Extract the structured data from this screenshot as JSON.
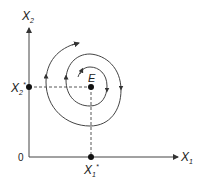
{
  "diagram": {
    "type": "phase-plane",
    "axes": {
      "x_label": "X",
      "x_sub": "1",
      "y_label": "X",
      "y_sub": "2",
      "origin_label": "0"
    },
    "equilibrium": {
      "label": "E",
      "x_label": "X",
      "x_sub": "1",
      "x_sup": "*",
      "y_label": "X",
      "y_sub": "2",
      "y_sup": "*"
    },
    "trajectory": "spiral converging toward equilibrium E (counter-clockwise)",
    "colors": {
      "line": "#333333",
      "background": "#ffffff"
    }
  }
}
